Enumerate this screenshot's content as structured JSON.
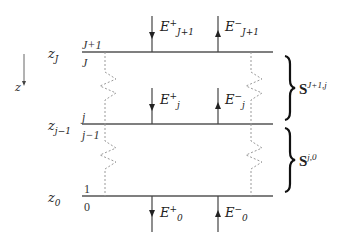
{
  "axis": {
    "label": "z",
    "direction": "down"
  },
  "interfaces": [
    {
      "name": "z_J",
      "symbol": "z",
      "subscript": "J",
      "above_index": "J+1",
      "below_index": "J"
    },
    {
      "name": "z_j-1",
      "symbol": "z",
      "subscript": "j−1",
      "above_index": "j",
      "below_index": "j−1"
    },
    {
      "name": "z_0",
      "symbol": "z",
      "subscript": "0",
      "above_index": "1",
      "below_index": "0"
    }
  ],
  "fields": {
    "top_down": {
      "symbol": "E",
      "sup": "+",
      "sub": "J+1"
    },
    "top_up": {
      "symbol": "E",
      "sup": "−",
      "sub": "J+1"
    },
    "mid_down": {
      "symbol": "E",
      "sup": "+",
      "sub": "j"
    },
    "mid_up": {
      "symbol": "E",
      "sup": "−",
      "sub": "j"
    },
    "bottom_down": {
      "symbol": "E",
      "sup": "+",
      "sub": "0"
    },
    "bottom_up": {
      "symbol": "E",
      "sup": "−",
      "sub": "0"
    }
  },
  "scattering_matrices": [
    {
      "symbol": "S",
      "sup": "J+1,j"
    },
    {
      "symbol": "S",
      "sup": "j,0"
    }
  ],
  "colors": {
    "line": "#555555",
    "dotted": "#999999",
    "text": "#222222"
  }
}
